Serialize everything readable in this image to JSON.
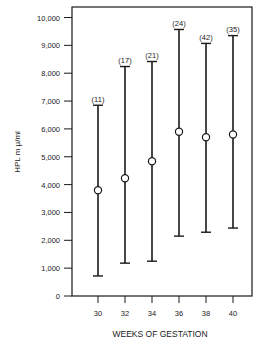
{
  "chart_data": {
    "type": "errorbar",
    "title": "",
    "xlabel": "WEEKS OF GESTATION",
    "ylabel": "HPL m μ/ml",
    "ylim": [
      0,
      10000
    ],
    "grid": false,
    "legend": null,
    "y_ticks": [
      "0",
      "1,000",
      "2,000",
      "3,000",
      "4,000",
      "5,000",
      "6,000",
      "7,000",
      "8,000",
      "9,000",
      "10,000"
    ],
    "y_tick_values": [
      0,
      1000,
      2000,
      3000,
      4000,
      5000,
      6000,
      7000,
      8000,
      9000,
      10000
    ],
    "categories": [
      "30",
      "32",
      "34",
      "36",
      "38",
      "40"
    ],
    "series": [
      {
        "name": "HPL",
        "mean": [
          3800,
          4230,
          4840,
          5900,
          5700,
          5800
        ],
        "upper": [
          6850,
          8240,
          8420,
          9570,
          9070,
          9350
        ],
        "lower": [
          720,
          1180,
          1250,
          2150,
          2290,
          2440
        ],
        "n_labels": [
          "(11)",
          "(17)",
          "(21)",
          "(24)",
          "(42)",
          "(35)"
        ]
      }
    ]
  }
}
